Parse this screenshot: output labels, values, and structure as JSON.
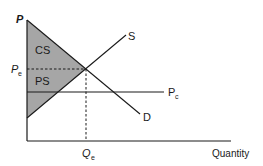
{
  "diagram": {
    "type": "supply-demand",
    "labels": {
      "y_axis": "P",
      "x_axis": "Quantity",
      "supply": "S",
      "demand": "D",
      "equilibrium_price": "P",
      "equilibrium_price_sub": "e",
      "ceiling_price": "P",
      "ceiling_price_sub": "c",
      "equilibrium_quantity": "Q",
      "equilibrium_quantity_sub": "e",
      "consumer_surplus": "CS",
      "producer_surplus": "PS"
    },
    "colors": {
      "line": "#1a1a1a",
      "shading": "#a6a6a6",
      "background": "#ffffff"
    }
  }
}
